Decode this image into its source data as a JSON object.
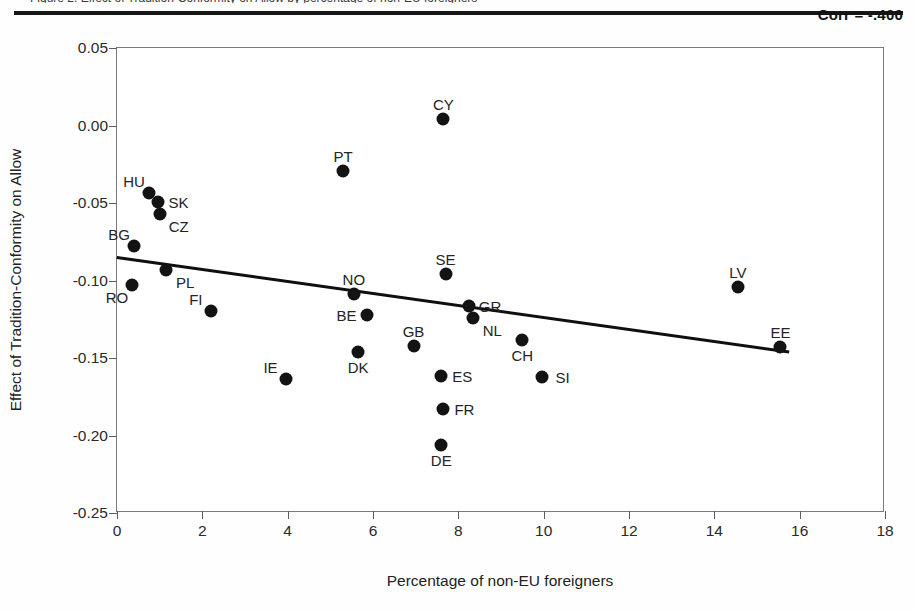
{
  "figure": {
    "clipped_caption": "Figure 2. Effect of Tradition-Conformity on Allow by percentage of non-EU foreigners",
    "corr_label": "Corr = -.400"
  },
  "axes": {
    "xlabel": "Percentage of non-EU foreigners",
    "ylabel": "Effect of Tradition-Conformity on Allow",
    "xticks": [
      "0",
      "2",
      "4",
      "6",
      "8",
      "10",
      "12",
      "14",
      "16",
      "18"
    ],
    "yticks": [
      "0.05",
      "0.00",
      "-0.05",
      "-0.10",
      "-0.15",
      "-0.20",
      "-0.25"
    ]
  },
  "chart_data": {
    "type": "scatter",
    "title": "",
    "xlabel": "Percentage of non-EU foreigners",
    "ylabel": "Effect of Tradition-Conformity on Allow",
    "xlim": [
      0,
      18
    ],
    "ylim": [
      -0.25,
      0.05
    ],
    "xticks": [
      0,
      2,
      4,
      6,
      8,
      10,
      12,
      14,
      16,
      18
    ],
    "yticks": [
      0.05,
      0.0,
      -0.05,
      -0.1,
      -0.15,
      -0.2,
      -0.25
    ],
    "grid": false,
    "legend": false,
    "annotations": [
      {
        "text": "Corr = -.400",
        "position": "top-right"
      }
    ],
    "trendline": {
      "type": "linear",
      "x_start": 0.0,
      "y_start": -0.0845,
      "x_end": 15.75,
      "y_end": -0.1455
    },
    "points": [
      {
        "label": "HU",
        "x": 0.75,
        "y": -0.0435,
        "label_pos": "up-left"
      },
      {
        "label": "SK",
        "x": 0.95,
        "y": -0.0495,
        "label_pos": "right"
      },
      {
        "label": "CZ",
        "x": 1.0,
        "y": -0.057,
        "label_pos": "down-right"
      },
      {
        "label": "BG",
        "x": 0.4,
        "y": -0.0775,
        "label_pos": "up-left"
      },
      {
        "label": "PL",
        "x": 1.15,
        "y": -0.0935,
        "label_pos": "down-right"
      },
      {
        "label": "RO",
        "x": 0.35,
        "y": -0.103,
        "label_pos": "down-left"
      },
      {
        "label": "FI",
        "x": 2.2,
        "y": -0.1195,
        "label_pos": "up-left"
      },
      {
        "label": "IE",
        "x": 3.95,
        "y": -0.1635,
        "label_pos": "up-left"
      },
      {
        "label": "PT",
        "x": 5.3,
        "y": -0.0295,
        "label_pos": "up"
      },
      {
        "label": "CY",
        "x": 7.65,
        "y": 0.004,
        "label_pos": "up"
      },
      {
        "label": "NO",
        "x": 5.55,
        "y": -0.109,
        "label_pos": "up"
      },
      {
        "label": "BE",
        "x": 5.85,
        "y": -0.1225,
        "label_pos": "left"
      },
      {
        "label": "DK",
        "x": 5.65,
        "y": -0.146,
        "label_pos": "down"
      },
      {
        "label": "GB",
        "x": 6.95,
        "y": -0.1425,
        "label_pos": "up"
      },
      {
        "label": "SE",
        "x": 7.7,
        "y": -0.0955,
        "label_pos": "up"
      },
      {
        "label": "GR",
        "x": 8.25,
        "y": -0.1165,
        "label_pos": "right"
      },
      {
        "label": "NL",
        "x": 8.35,
        "y": -0.1245,
        "label_pos": "down-right"
      },
      {
        "label": "ES",
        "x": 7.6,
        "y": -0.1615,
        "label_pos": "right"
      },
      {
        "label": "FR",
        "x": 7.65,
        "y": -0.183,
        "label_pos": "right"
      },
      {
        "label": "DE",
        "x": 7.6,
        "y": -0.206,
        "label_pos": "down"
      },
      {
        "label": "CH",
        "x": 9.5,
        "y": -0.1385,
        "label_pos": "down"
      },
      {
        "label": "SI",
        "x": 9.95,
        "y": -0.1625,
        "label_pos": "right"
      },
      {
        "label": "LV",
        "x": 14.55,
        "y": -0.1045,
        "label_pos": "up"
      },
      {
        "label": "EE",
        "x": 15.55,
        "y": -0.143,
        "label_pos": "up"
      }
    ]
  }
}
